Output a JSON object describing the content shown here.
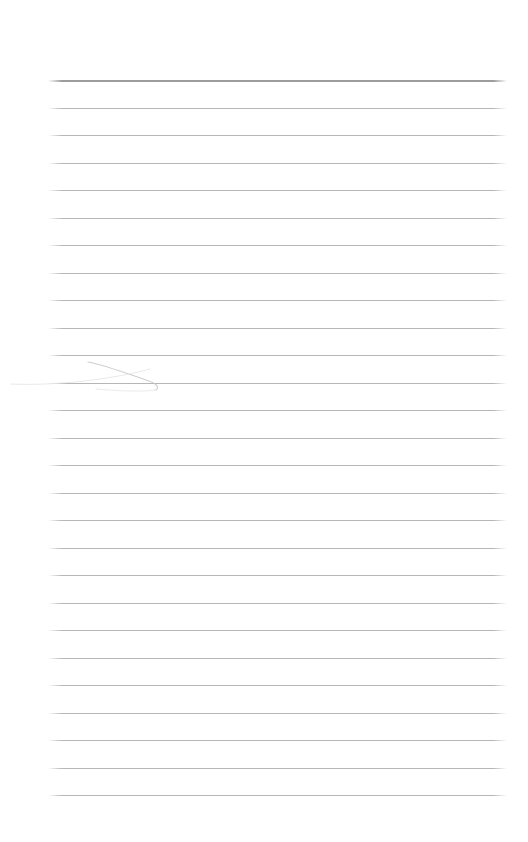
{
  "page": {
    "kind": "ruled-notepad-sheet",
    "width": 528,
    "height": 842,
    "background_color": "#ffffff",
    "content_text": "",
    "is_blank": true
  },
  "ruling": {
    "line_count": 27,
    "first_line_y": 80,
    "line_spacing": 27.5,
    "left_margin_x": 48,
    "right_margin_x": 507,
    "line_length": 459,
    "line_color": "#b4b6b8",
    "header_rule_color": "#9a9c9e",
    "header_rule_thickness": 2,
    "line_thickness": 1,
    "lines": [
      {
        "index": 1,
        "y": 80,
        "emphasis": "header"
      },
      {
        "index": 2,
        "y": 107.5,
        "emphasis": "normal"
      },
      {
        "index": 3,
        "y": 135,
        "emphasis": "normal"
      },
      {
        "index": 4,
        "y": 162.5,
        "emphasis": "normal"
      },
      {
        "index": 5,
        "y": 190,
        "emphasis": "normal"
      },
      {
        "index": 6,
        "y": 217.5,
        "emphasis": "normal"
      },
      {
        "index": 7,
        "y": 245,
        "emphasis": "normal"
      },
      {
        "index": 8,
        "y": 272.5,
        "emphasis": "normal"
      },
      {
        "index": 9,
        "y": 300,
        "emphasis": "normal"
      },
      {
        "index": 10,
        "y": 327.5,
        "emphasis": "normal"
      },
      {
        "index": 11,
        "y": 355,
        "emphasis": "normal"
      },
      {
        "index": 12,
        "y": 382.5,
        "emphasis": "normal"
      },
      {
        "index": 13,
        "y": 410,
        "emphasis": "normal"
      },
      {
        "index": 14,
        "y": 437.5,
        "emphasis": "normal"
      },
      {
        "index": 15,
        "y": 465,
        "emphasis": "normal"
      },
      {
        "index": 16,
        "y": 492.5,
        "emphasis": "normal"
      },
      {
        "index": 17,
        "y": 520,
        "emphasis": "normal"
      },
      {
        "index": 18,
        "y": 547.5,
        "emphasis": "normal"
      },
      {
        "index": 19,
        "y": 575,
        "emphasis": "normal"
      },
      {
        "index": 20,
        "y": 602.5,
        "emphasis": "normal"
      },
      {
        "index": 21,
        "y": 630,
        "emphasis": "normal"
      },
      {
        "index": 22,
        "y": 657.5,
        "emphasis": "normal"
      },
      {
        "index": 23,
        "y": 685,
        "emphasis": "normal"
      },
      {
        "index": 24,
        "y": 712.5,
        "emphasis": "normal"
      },
      {
        "index": 25,
        "y": 740,
        "emphasis": "normal"
      },
      {
        "index": 26,
        "y": 767.5,
        "emphasis": "normal"
      },
      {
        "index": 27,
        "y": 795,
        "emphasis": "normal"
      }
    ]
  },
  "annotations": [
    {
      "id": "faint-pencil-stroke",
      "description": "faint hook-shaped pencil stroke crossing line 11",
      "near_line_index": 11,
      "color": "#c9cbcd",
      "bounds": {
        "x": 10,
        "y": 344,
        "width": 150,
        "height": 32
      }
    }
  ]
}
